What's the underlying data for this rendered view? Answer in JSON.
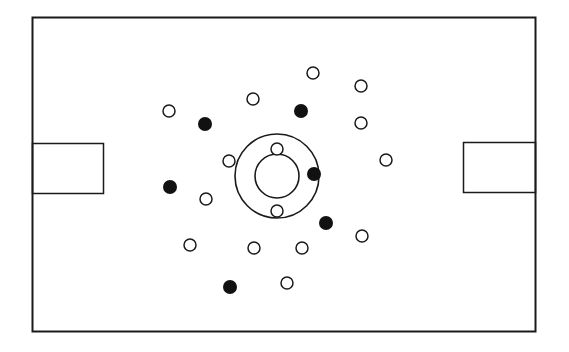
{
  "diagram": {
    "title": "",
    "colors": {
      "line": "#1a1a1a",
      "background": "#ffffff",
      "team_open": "#ffffff",
      "team_filled": "#111111"
    },
    "legend": {
      "open": "open circle player",
      "filled": "filled circle player"
    },
    "players": {
      "open": [
        {
          "id": "o1"
        },
        {
          "id": "o2"
        },
        {
          "id": "o3"
        },
        {
          "id": "o4"
        },
        {
          "id": "o5"
        },
        {
          "id": "o6"
        },
        {
          "id": "o7"
        },
        {
          "id": "o8"
        },
        {
          "id": "o9"
        },
        {
          "id": "o10"
        },
        {
          "id": "o11"
        },
        {
          "id": "o12"
        },
        {
          "id": "o13"
        },
        {
          "id": "o14"
        },
        {
          "id": "o15"
        }
      ],
      "filled": [
        {
          "id": "f1"
        },
        {
          "id": "f2"
        },
        {
          "id": "f3"
        },
        {
          "id": "f4"
        },
        {
          "id": "f5"
        },
        {
          "id": "f6"
        }
      ],
      "count_open": 15,
      "count_filled": 6
    }
  }
}
